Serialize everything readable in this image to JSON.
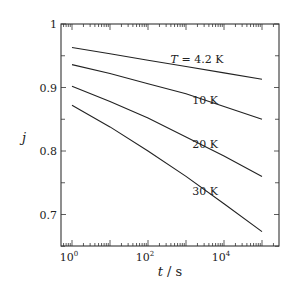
{
  "chart_data": {
    "type": "line",
    "title": "",
    "xlabel": "t / s",
    "xlabel_var": "t",
    "xlabel_unit": " / s",
    "ylabel": "j",
    "xscale": "log",
    "xlim": [
      0.7,
      200000
    ],
    "ylim": [
      0.65,
      1.0
    ],
    "grid": false,
    "legend": "inline labels",
    "x_ticks": [
      {
        "value": 1,
        "label": "10",
        "exp": "0"
      },
      {
        "value": 100,
        "label": "10",
        "exp": "2"
      },
      {
        "value": 10000,
        "label": "10",
        "exp": "4"
      }
    ],
    "y_ticks": [
      {
        "value": 1.0,
        "label": "1"
      },
      {
        "value": 0.9,
        "label": "0.9"
      },
      {
        "value": 0.8,
        "label": "0.8"
      },
      {
        "value": 0.7,
        "label": "0.7"
      }
    ],
    "x": [
      1,
      10,
      100,
      1000,
      10000,
      100000
    ],
    "series": [
      {
        "name": "T = 4.2 K",
        "label": "T = 4.2 K",
        "values": [
          0.963,
          0.953,
          0.943,
          0.933,
          0.923,
          0.913
        ]
      },
      {
        "name": "10 K",
        "label": "10 K",
        "values": [
          0.936,
          0.922,
          0.906,
          0.89,
          0.87,
          0.85
        ]
      },
      {
        "name": "20 K",
        "label": "20 K",
        "values": [
          0.902,
          0.878,
          0.852,
          0.822,
          0.792,
          0.76
        ]
      },
      {
        "name": "30 K",
        "label": "30 K",
        "values": [
          0.872,
          0.838,
          0.8,
          0.76,
          0.717,
          0.673
        ]
      }
    ]
  }
}
